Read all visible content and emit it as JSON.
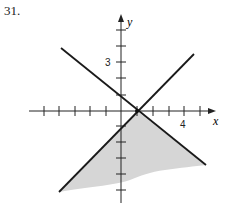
{
  "problem_number": "31.",
  "axes": {
    "x_label": "x",
    "y_label": "y",
    "x_tick_label": "4",
    "y_tick_label": "3"
  },
  "lines": [
    {
      "name": "decreasing-line",
      "from": [
        61,
        48
      ],
      "to": [
        206,
        165
      ]
    },
    {
      "name": "increasing-line",
      "from": [
        59,
        192
      ],
      "to": [
        194,
        54
      ]
    }
  ],
  "shading": {
    "color": "#d6d6d6",
    "description": "region below both lines"
  }
}
